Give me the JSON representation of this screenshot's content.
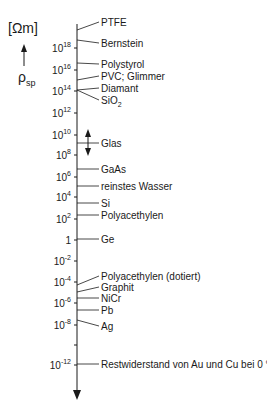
{
  "axis": {
    "unit": "[Ωm]",
    "quantity": "ρ",
    "quantity_sub": "sp",
    "ticks": [
      {
        "label": "10",
        "exp": "18",
        "y": 48
      },
      {
        "label": "10",
        "exp": "16",
        "y": 70
      },
      {
        "label": "10",
        "exp": "14",
        "y": 91
      },
      {
        "label": "10",
        "exp": "12",
        "y": 113
      },
      {
        "label": "10",
        "exp": "10",
        "y": 135
      },
      {
        "label": "10",
        "exp": "8",
        "y": 155
      },
      {
        "label": "10",
        "exp": "6",
        "y": 177
      },
      {
        "label": "10",
        "exp": "4",
        "y": 197
      },
      {
        "label": "10",
        "exp": "2",
        "y": 219
      },
      {
        "label": "1",
        "exp": "",
        "y": 240
      },
      {
        "label": "10",
        "exp": "-2",
        "y": 261
      },
      {
        "label": "10",
        "exp": "-4",
        "y": 282
      },
      {
        "label": "10",
        "exp": "-6",
        "y": 303
      },
      {
        "label": "10",
        "exp": "-8",
        "y": 325
      },
      {
        "label": "",
        "exp": "",
        "y": 345
      },
      {
        "label": "10",
        "exp": "-12",
        "y": 365
      }
    ]
  },
  "materials": [
    {
      "name": "PTFE",
      "ay": 30,
      "ty": 22
    },
    {
      "name": "Bernstein",
      "ay": 40,
      "ty": 43
    },
    {
      "name": "Polystyrol",
      "ay": 63,
      "ty": 64
    },
    {
      "name": "PVC; Glimmer",
      "ay": 80,
      "ty": 76
    },
    {
      "name": "Diamant",
      "ay": 90,
      "ty": 88
    },
    {
      "name": "SiO",
      "sub": "2",
      "ay": 90,
      "ty": 100
    },
    {
      "name": "Glas",
      "ay": 143,
      "ty": 143
    },
    {
      "name": "GaAs",
      "ay": 169,
      "ty": 169
    },
    {
      "name": "reinstes Wasser",
      "ay": 186,
      "ty": 186
    },
    {
      "name": "Si",
      "ay": 203,
      "ty": 203
    },
    {
      "name": "Polyacethylen",
      "ay": 215,
      "ty": 215
    },
    {
      "name": "Ge",
      "ay": 239,
      "ty": 239
    },
    {
      "name": "Polyacethylen (dotiert)",
      "ay": 285,
      "ty": 276
    },
    {
      "name": "Graphit",
      "ay": 292,
      "ty": 287
    },
    {
      "name": "NiCr",
      "ay": 298,
      "ty": 298
    },
    {
      "name": "Pb",
      "ay": 310,
      "ty": 310
    },
    {
      "name": "Ag",
      "ay": 320,
      "ty": 326
    },
    {
      "name": "Restwiderstand von Au und Cu bei 0 °K",
      "ay": 364,
      "ty": 364
    }
  ],
  "glas_range_arrows": {
    "up_y": 135,
    "down_y": 150
  }
}
